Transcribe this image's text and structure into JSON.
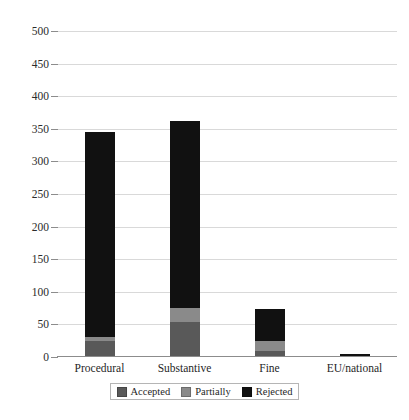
{
  "chart_data": {
    "type": "bar",
    "subtype": "stacked-vertical",
    "title": "",
    "xlabel": "",
    "ylabel": "",
    "categories": [
      "Procedural",
      "Substantive",
      "Fine",
      "EU/national"
    ],
    "series": [
      {
        "name": "Accepted",
        "color": "#595959",
        "values": [
          25,
          54,
          9,
          0
        ]
      },
      {
        "name": "Partially",
        "color": "#8a8a8a",
        "values": [
          5,
          21,
          15,
          1
        ]
      },
      {
        "name": "Rejected",
        "color": "#111111",
        "values": [
          315,
          287,
          50,
          4
        ]
      }
    ],
    "totals": [
      345,
      362,
      74,
      5
    ],
    "ylim": [
      0,
      500
    ],
    "yticks": [
      0,
      50,
      100,
      150,
      200,
      250,
      300,
      350,
      400,
      450,
      500
    ],
    "ytick_labels": [
      "0",
      "50",
      "100",
      "150",
      "200",
      "250",
      "300",
      "350",
      "400",
      "450",
      "500"
    ],
    "grid": true,
    "grid_axis": "y",
    "grid_color": "#d9d9d9",
    "axis_color": "#8c8c8c",
    "legend": {
      "position": "bottom-center",
      "entries": [
        {
          "label": "Accepted",
          "color": "#595959"
        },
        {
          "label": "Partially",
          "color": "#8a8a8a"
        },
        {
          "label": "Rejected",
          "color": "#111111"
        }
      ]
    },
    "background": "#ffffff"
  }
}
